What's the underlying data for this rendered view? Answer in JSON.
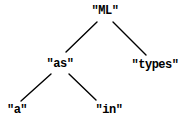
{
  "diagram": {
    "type": "tree",
    "nodes": {
      "ml": {
        "label": "\"ML\""
      },
      "as": {
        "label": "\"as\""
      },
      "types": {
        "label": "\"types\""
      },
      "a": {
        "label": "\"a\""
      },
      "in": {
        "label": "\"in\""
      }
    },
    "edges": [
      {
        "from": "\"ML\"",
        "to": "\"as\""
      },
      {
        "from": "\"ML\"",
        "to": "\"types\""
      },
      {
        "from": "\"as\"",
        "to": "\"a\""
      },
      {
        "from": "\"as\"",
        "to": "\"in\""
      }
    ],
    "colors": {
      "text": "#000000",
      "edge": "#000000",
      "background": "#ffffff"
    }
  }
}
